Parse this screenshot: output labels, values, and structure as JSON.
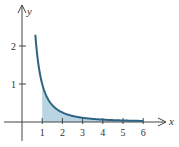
{
  "chart_data": {
    "type": "area",
    "title": "",
    "function": "y = 1/x^2",
    "xlabel": "x",
    "ylabel": "y",
    "x_ticks": [
      1,
      2,
      3,
      4,
      5,
      6
    ],
    "x_tick_labels": [
      "1",
      "2",
      "3",
      "4",
      "5",
      "6"
    ],
    "y_ticks": [
      1,
      2
    ],
    "y_tick_labels": [
      "1",
      "2"
    ],
    "xlim": [
      -0.9,
      7.0
    ],
    "ylim": [
      -0.6,
      3.1
    ],
    "curve_domain": [
      0.66,
      6
    ],
    "shaded_region": {
      "from": 1,
      "to": 6,
      "description": "area under curve between x=1 and x=6"
    },
    "grid": false,
    "legend": null,
    "colors": {
      "curve": "#2e6382",
      "fill": "#b9d4e2",
      "axis": "#444444"
    }
  },
  "labels": {
    "x_axis": "x",
    "y_axis": "y",
    "x_ticks": [
      "1",
      "2",
      "3",
      "4",
      "5",
      "6"
    ],
    "y_ticks": [
      "1",
      "2"
    ]
  }
}
